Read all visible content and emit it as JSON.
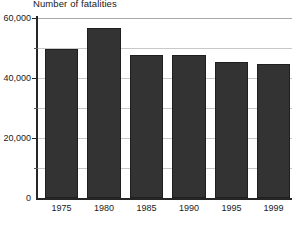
{
  "chart_data": {
    "type": "bar",
    "title": "Number of fatalities",
    "xlabel": "",
    "ylabel": "",
    "categories": [
      "1975",
      "1980",
      "1985",
      "1990",
      "1995",
      "1999"
    ],
    "values": [
      49800,
      56500,
      47500,
      47500,
      45200,
      44800
    ],
    "ylim": [
      0,
      60000
    ],
    "y_ticks": [
      0,
      20000,
      40000,
      60000
    ],
    "y_tick_labels": [
      "0",
      "20,000",
      "40,000",
      "60,000"
    ],
    "y_minor_ticks": [
      10000,
      30000,
      50000
    ],
    "grid": true,
    "grid_axis": "y",
    "legend": false,
    "series": [
      {
        "name": "Number of fatalities",
        "values": [
          49800,
          56500,
          47500,
          47500,
          45200,
          44800
        ]
      }
    ],
    "colors": {
      "bar": "#333333",
      "bar_border": "#1f1f1f",
      "gridline": "#c8c8c8",
      "axis": "#262626",
      "text": "#1a1a1a",
      "background": "#ffffff"
    }
  }
}
